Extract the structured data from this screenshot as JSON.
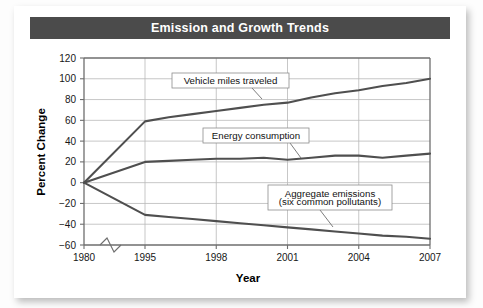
{
  "card": {
    "title": "Emission and Growth Trends",
    "title_bg": "#4b4b4b",
    "title_color": "#ffffff"
  },
  "chart_data": {
    "type": "line",
    "title": "Emission and Growth Trends",
    "xlabel": "Year",
    "ylabel": "Percent Change",
    "x": [
      1980,
      1995,
      1996,
      1997,
      1998,
      1999,
      2000,
      2001,
      2002,
      2003,
      2004,
      2005,
      2006,
      2007
    ],
    "xtick_labels": [
      "1980",
      "1995",
      "1998",
      "2001",
      "2004",
      "2007"
    ],
    "xticks": [
      1980,
      1995,
      1998,
      2001,
      2004,
      2007
    ],
    "axis_break": true,
    "axis_break_between": [
      1980,
      1995
    ],
    "ytick_labels": [
      "120",
      "100",
      "80",
      "60",
      "40",
      "20",
      "0",
      "-20",
      "-40",
      "-60"
    ],
    "yticks": [
      120,
      100,
      80,
      60,
      40,
      20,
      0,
      -20,
      -40,
      -60
    ],
    "ylim": [
      -60,
      120
    ],
    "grid": true,
    "legend": "annotations",
    "series": [
      {
        "name": "Vehicle miles traveled",
        "color": "#4f4f4f",
        "values": [
          0,
          59,
          63,
          66,
          69,
          72,
          75,
          77,
          82,
          86,
          89,
          93,
          96,
          100
        ]
      },
      {
        "name": "Energy consumption",
        "color": "#4f4f4f",
        "values": [
          0,
          20,
          21,
          22,
          23,
          23,
          24,
          22,
          24,
          26,
          26,
          24,
          26,
          28
        ]
      },
      {
        "name": "Aggregate emissions (six common pollutants)",
        "color": "#4f4f4f",
        "values": [
          0,
          -31,
          -33,
          -35,
          -37,
          -39,
          -41,
          -43,
          -45,
          -47,
          -49,
          -51,
          -52,
          -54
        ]
      }
    ],
    "annotations": [
      {
        "id": "vehicle-miles-traveled",
        "lines": [
          "Vehicle miles traveled"
        ],
        "box_x": 172,
        "box_y": 73,
        "box_w": 117,
        "box_h": 15,
        "leader": "M 252 88 L 262 99"
      },
      {
        "id": "energy-consumption",
        "lines": [
          "Energy consumption"
        ],
        "box_x": 203,
        "box_y": 128,
        "box_w": 106,
        "box_h": 15,
        "leader": "M 290 143 L 301 158"
      },
      {
        "id": "aggregate-emissions",
        "lines": [
          "Aggregate emissions",
          "(six common pollutants)"
        ],
        "box_x": 268,
        "box_y": 185,
        "box_w": 124,
        "box_h": 25,
        "leader": "M 320 210 L 333 227"
      }
    ]
  }
}
